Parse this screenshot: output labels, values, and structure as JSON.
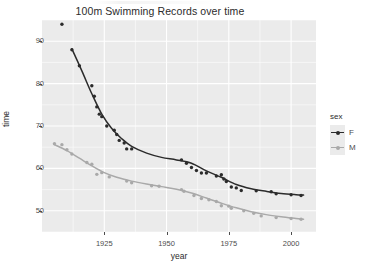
{
  "chart_data": {
    "type": "scatter",
    "title": "100m Swimming Records over time",
    "xlabel": "year",
    "ylabel": "time",
    "xlim": [
      1900,
      2010
    ],
    "ylim": [
      45,
      95
    ],
    "xticks": [
      1925,
      1950,
      1975,
      2000
    ],
    "yticks": [
      50,
      60,
      70,
      80,
      90
    ],
    "grid": true,
    "legend": {
      "title": "sex",
      "position": "right",
      "entries": [
        {
          "label": "F",
          "color": "#2b2b2b"
        },
        {
          "label": "M",
          "color": "#a9a9a9"
        }
      ]
    },
    "series": [
      {
        "name": "F",
        "color": "#2b2b2b",
        "points": [
          {
            "x": 1908,
            "y": 94.0
          },
          {
            "x": 1912,
            "y": 88.0
          },
          {
            "x": 1915,
            "y": 84.2
          },
          {
            "x": 1920,
            "y": 79.5
          },
          {
            "x": 1921,
            "y": 77.0
          },
          {
            "x": 1922,
            "y": 74.5
          },
          {
            "x": 1923,
            "y": 72.8
          },
          {
            "x": 1924,
            "y": 72.2
          },
          {
            "x": 1926,
            "y": 70.0
          },
          {
            "x": 1929,
            "y": 69.0
          },
          {
            "x": 1930,
            "y": 68.0
          },
          {
            "x": 1931,
            "y": 66.6
          },
          {
            "x": 1933,
            "y": 66.0
          },
          {
            "x": 1934,
            "y": 64.6
          },
          {
            "x": 1936,
            "y": 64.6
          },
          {
            "x": 1956,
            "y": 62.0
          },
          {
            "x": 1958,
            "y": 61.2
          },
          {
            "x": 1960,
            "y": 60.2
          },
          {
            "x": 1962,
            "y": 59.5
          },
          {
            "x": 1964,
            "y": 58.9
          },
          {
            "x": 1966,
            "y": 58.9
          },
          {
            "x": 1970,
            "y": 58.2
          },
          {
            "x": 1972,
            "y": 58.5
          },
          {
            "x": 1973,
            "y": 57.5
          },
          {
            "x": 1974,
            "y": 56.9
          },
          {
            "x": 1976,
            "y": 55.6
          },
          {
            "x": 1978,
            "y": 55.4
          },
          {
            "x": 1980,
            "y": 54.8
          },
          {
            "x": 1986,
            "y": 54.7
          },
          {
            "x": 1992,
            "y": 54.5
          },
          {
            "x": 1994,
            "y": 54.0
          },
          {
            "x": 2000,
            "y": 53.8
          },
          {
            "x": 2004,
            "y": 53.6
          }
        ],
        "smooth": [
          {
            "x": 1912,
            "y": 88.2
          },
          {
            "x": 1916,
            "y": 83.0
          },
          {
            "x": 1920,
            "y": 77.6
          },
          {
            "x": 1924,
            "y": 72.8
          },
          {
            "x": 1928,
            "y": 69.4
          },
          {
            "x": 1932,
            "y": 67.0
          },
          {
            "x": 1936,
            "y": 65.2
          },
          {
            "x": 1942,
            "y": 63.6
          },
          {
            "x": 1948,
            "y": 62.6
          },
          {
            "x": 1954,
            "y": 62.0
          },
          {
            "x": 1960,
            "y": 61.2
          },
          {
            "x": 1966,
            "y": 59.4
          },
          {
            "x": 1972,
            "y": 57.9
          },
          {
            "x": 1978,
            "y": 56.2
          },
          {
            "x": 1984,
            "y": 55.2
          },
          {
            "x": 1990,
            "y": 54.6
          },
          {
            "x": 1996,
            "y": 54.1
          },
          {
            "x": 2002,
            "y": 53.8
          },
          {
            "x": 2005,
            "y": 53.7
          }
        ]
      },
      {
        "name": "M",
        "color": "#a9a9a9",
        "points": [
          {
            "x": 1905,
            "y": 65.8
          },
          {
            "x": 1908,
            "y": 65.6
          },
          {
            "x": 1910,
            "y": 64.4
          },
          {
            "x": 1912,
            "y": 63.4
          },
          {
            "x": 1918,
            "y": 61.4
          },
          {
            "x": 1920,
            "y": 61.0
          },
          {
            "x": 1922,
            "y": 58.6
          },
          {
            "x": 1924,
            "y": 59.0
          },
          {
            "x": 1927,
            "y": 58.0
          },
          {
            "x": 1934,
            "y": 57.0
          },
          {
            "x": 1936,
            "y": 56.6
          },
          {
            "x": 1944,
            "y": 55.9
          },
          {
            "x": 1947,
            "y": 55.8
          },
          {
            "x": 1956,
            "y": 55.0
          },
          {
            "x": 1957,
            "y": 54.6
          },
          {
            "x": 1961,
            "y": 53.6
          },
          {
            "x": 1964,
            "y": 52.9
          },
          {
            "x": 1967,
            "y": 52.6
          },
          {
            "x": 1970,
            "y": 52.2
          },
          {
            "x": 1972,
            "y": 51.2
          },
          {
            "x": 1975,
            "y": 51.1
          },
          {
            "x": 1976,
            "y": 50.6
          },
          {
            "x": 1981,
            "y": 50.0
          },
          {
            "x": 1985,
            "y": 49.4
          },
          {
            "x": 1988,
            "y": 48.8
          },
          {
            "x": 1994,
            "y": 48.4
          },
          {
            "x": 2000,
            "y": 48.2
          },
          {
            "x": 2004,
            "y": 48.0
          }
        ],
        "smooth": [
          {
            "x": 1905,
            "y": 65.6
          },
          {
            "x": 1910,
            "y": 64.2
          },
          {
            "x": 1915,
            "y": 62.4
          },
          {
            "x": 1920,
            "y": 60.6
          },
          {
            "x": 1925,
            "y": 59.0
          },
          {
            "x": 1930,
            "y": 57.9
          },
          {
            "x": 1936,
            "y": 57.0
          },
          {
            "x": 1942,
            "y": 56.3
          },
          {
            "x": 1948,
            "y": 55.7
          },
          {
            "x": 1954,
            "y": 55.1
          },
          {
            "x": 1960,
            "y": 54.2
          },
          {
            "x": 1966,
            "y": 53.0
          },
          {
            "x": 1972,
            "y": 51.8
          },
          {
            "x": 1978,
            "y": 50.7
          },
          {
            "x": 1984,
            "y": 49.8
          },
          {
            "x": 1990,
            "y": 49.1
          },
          {
            "x": 1996,
            "y": 48.6
          },
          {
            "x": 2002,
            "y": 48.2
          },
          {
            "x": 2005,
            "y": 48.0
          }
        ]
      }
    ]
  },
  "panel": {
    "bg_color": "#ebebeb",
    "grid_color": "#ffffff"
  }
}
